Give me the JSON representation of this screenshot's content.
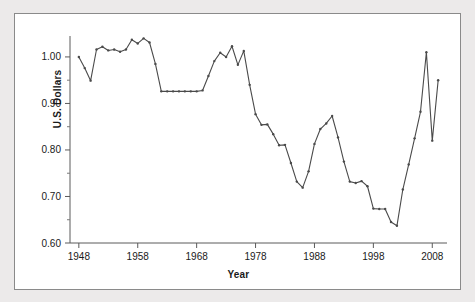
{
  "figure": {
    "background_color": "#eceaea",
    "panel_color": "#ffffff",
    "border_color": "#8a8a8a",
    "line_color": "#4a4a4a"
  },
  "labels": {
    "ylabel": "U.S. Dollars",
    "xlabel": "Year"
  },
  "chart_data": {
    "type": "line",
    "title": "",
    "xlabel": "Year",
    "ylabel": "U.S. Dollars",
    "xlim": [
      1946.5,
      2010.5
    ],
    "ylim": [
      0.6,
      1.045
    ],
    "xticks": [
      1948,
      1958,
      1968,
      1978,
      1988,
      1998,
      2008
    ],
    "xtick_labels": [
      "1948",
      "1958",
      "1968",
      "1978",
      "1988",
      "1998",
      "2008"
    ],
    "yticks": [
      0.6,
      0.7,
      0.8,
      0.9,
      1.0
    ],
    "ytick_labels": [
      "0.60",
      "0.70",
      "0.80",
      "0.90",
      "1.00"
    ],
    "yticks_minor": [
      0.65,
      0.75,
      0.85,
      0.95
    ],
    "grid": false,
    "legend": null,
    "marker": "point",
    "series": [
      {
        "name": "Canadian dollar in U.S. dollars",
        "x": [
          1948,
          1949,
          1950,
          1951,
          1952,
          1953,
          1954,
          1955,
          1956,
          1957,
          1958,
          1959,
          1960,
          1961,
          1962,
          1963,
          1964,
          1965,
          1966,
          1967,
          1968,
          1969,
          1970,
          1971,
          1972,
          1973,
          1974,
          1975,
          1976,
          1977,
          1978,
          1979,
          1980,
          1981,
          1982,
          1983,
          1984,
          1985,
          1986,
          1987,
          1988,
          1989,
          1990,
          1991,
          1992,
          1993,
          1994,
          1995,
          1996,
          1997,
          1998,
          1999,
          2000,
          2001,
          2002,
          2003,
          2004,
          2005,
          2006,
          2007,
          2008,
          2009
        ],
        "values": [
          1.0,
          0.976,
          0.949,
          1.016,
          1.022,
          1.014,
          1.016,
          1.011,
          1.016,
          1.037,
          1.029,
          1.04,
          1.031,
          0.985,
          0.926,
          0.926,
          0.926,
          0.926,
          0.926,
          0.926,
          0.926,
          0.928,
          0.959,
          0.991,
          1.009,
          1.0,
          1.023,
          0.983,
          1.013,
          0.94,
          0.877,
          0.854,
          0.855,
          0.834,
          0.81,
          0.811,
          0.772,
          0.732,
          0.719,
          0.754,
          0.813,
          0.845,
          0.857,
          0.873,
          0.827,
          0.775,
          0.732,
          0.729,
          0.733,
          0.722,
          0.674,
          0.673,
          0.673,
          0.645,
          0.637,
          0.715,
          0.769,
          0.825,
          0.882,
          1.01,
          0.82,
          0.95
        ]
      }
    ]
  }
}
